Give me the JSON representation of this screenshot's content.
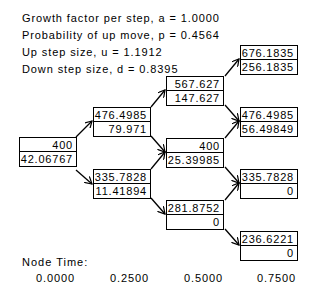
{
  "params": {
    "growth": "Growth factor per step, a = 1.0000",
    "prob": "Probability of up move, p = 0.4564",
    "up": "Up step size, u = 1.1912",
    "down": "Down step size, d = 0.8395"
  },
  "tree": {
    "step0": [
      {
        "price": "400",
        "value": "42.06767"
      }
    ],
    "step1": [
      {
        "price": "476.4985",
        "value": "79.971"
      },
      {
        "price": "335.7828",
        "value": "11.41894"
      }
    ],
    "step2": [
      {
        "price": "567.627",
        "value": "147.627"
      },
      {
        "price": "400",
        "value": "25.39985"
      },
      {
        "price": "281.8752",
        "value": "0"
      }
    ],
    "step3": [
      {
        "price": "676.1835",
        "value": "256.1835"
      },
      {
        "price": "476.4985",
        "value": "56.49849"
      },
      {
        "price": "335.7828",
        "value": "0"
      },
      {
        "price": "236.6221",
        "value": "0"
      }
    ]
  },
  "node_time": {
    "label": "Node Time:",
    "times": [
      "0.0000",
      "0.2500",
      "0.5000",
      "0.7500"
    ]
  }
}
